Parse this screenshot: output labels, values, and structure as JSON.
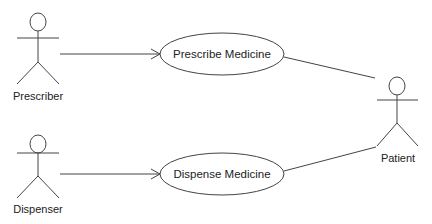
{
  "diagram": {
    "type": "uml-use-case",
    "colors": {
      "stroke": "#333333",
      "text": "#222222",
      "background": "#ffffff"
    },
    "actors": [
      {
        "id": "prescriber",
        "label": "Prescriber"
      },
      {
        "id": "dispenser",
        "label": "Dispenser"
      },
      {
        "id": "patient",
        "label": "Patient"
      }
    ],
    "use_cases": [
      {
        "id": "prescribe",
        "label": "Prescribe Medicine"
      },
      {
        "id": "dispense",
        "label": "Dispense Medicine"
      }
    ],
    "relationships": [
      {
        "from": "Prescriber",
        "to": "Prescribe Medicine",
        "style": "open-arrow"
      },
      {
        "from": "Dispenser",
        "to": "Dispense Medicine",
        "style": "open-arrow"
      },
      {
        "from": "Prescribe Medicine",
        "to": "Patient",
        "style": "line"
      },
      {
        "from": "Dispense Medicine",
        "to": "Patient",
        "style": "line"
      }
    ]
  }
}
